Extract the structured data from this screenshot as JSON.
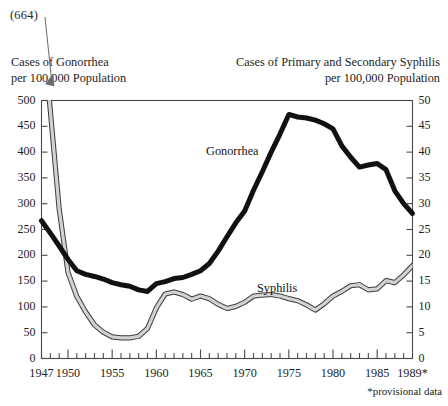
{
  "chart_data": {
    "type": "line",
    "title": "",
    "annotation_peak": "(664)",
    "footnote": "*provisional data",
    "left_axis": {
      "label_line1": "Cases of Gonorrhea",
      "label_line2": "per 100,000 Population",
      "ticks": [
        0,
        50,
        100,
        150,
        200,
        250,
        300,
        350,
        400,
        450,
        500
      ],
      "ylim": [
        0,
        500
      ]
    },
    "right_axis": {
      "label_line1": "Cases of Primary and Secondary Syphilis",
      "label_line2": "per 100,000 Population",
      "ticks": [
        0,
        5,
        10,
        15,
        20,
        25,
        30,
        35,
        40,
        45,
        50
      ],
      "ylim": [
        0,
        50
      ]
    },
    "xlabel": "",
    "xlim": [
      1947,
      1989
    ],
    "x_tick_labels": [
      "1947",
      "1950",
      "1955",
      "1960",
      "1965",
      "1970",
      "1975",
      "1980",
      "1985",
      "1989*"
    ],
    "x_tick_label_years": [
      1947,
      1950,
      1955,
      1960,
      1965,
      1970,
      1975,
      1980,
      1985,
      1989
    ],
    "x_minor_ticks_every": 1,
    "x_major_ticks_every": 5,
    "grid": false,
    "legend": "inline-labels",
    "x": [
      1947,
      1948,
      1949,
      1950,
      1951,
      1952,
      1953,
      1954,
      1955,
      1956,
      1957,
      1958,
      1959,
      1960,
      1961,
      1962,
      1963,
      1964,
      1965,
      1966,
      1967,
      1968,
      1969,
      1970,
      1971,
      1972,
      1973,
      1974,
      1975,
      1976,
      1977,
      1978,
      1979,
      1980,
      1981,
      1982,
      1983,
      1984,
      1985,
      1986,
      1987,
      1988,
      1989
    ],
    "series": [
      {
        "name": "Gonorrhea",
        "axis": "left",
        "color": "#111111",
        "style": "thick-solid",
        "values": [
          267,
          243,
          218,
          192,
          170,
          163,
          159,
          154,
          147,
          143,
          140,
          133,
          130,
          145,
          149,
          155,
          157,
          163,
          170,
          184,
          208,
          236,
          263,
          286,
          326,
          362,
          400,
          435,
          473,
          468,
          466,
          462,
          455,
          445,
          412,
          390,
          371,
          375,
          378,
          366,
          325,
          300,
          281
        ]
      },
      {
        "name": "Syphilis",
        "axis": "right",
        "color": "#9b9b9b",
        "style": "outlined-band",
        "values": [
          66.4,
          48.0,
          29.0,
          16.7,
          12.0,
          9.0,
          6.5,
          5.1,
          4.2,
          4.0,
          4.0,
          4.3,
          5.8,
          9.8,
          12.5,
          12.9,
          12.4,
          11.5,
          12.1,
          11.6,
          10.5,
          9.7,
          10.1,
          10.9,
          12.1,
          12.3,
          12.4,
          12.1,
          11.6,
          11.2,
          10.4,
          9.4,
          10.6,
          12.1,
          13.0,
          14.1,
          14.3,
          13.3,
          13.5,
          15.1,
          14.7,
          16.2,
          18.0
        ]
      }
    ]
  }
}
